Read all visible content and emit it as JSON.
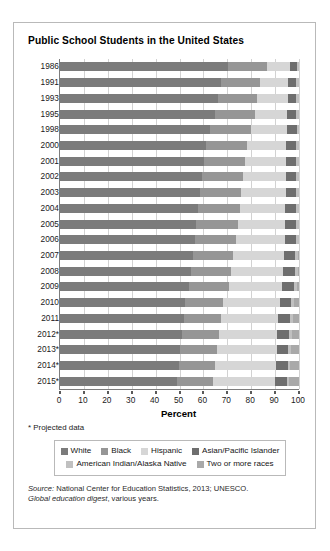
{
  "chart_data": {
    "type": "bar",
    "subtype": "stacked-horizontal-100-percent",
    "title": "Public School Students in the United States",
    "xlabel": "Percent",
    "ylabel": "",
    "xlim": [
      0,
      100
    ],
    "xticks": [
      0,
      10,
      20,
      30,
      40,
      50,
      60,
      70,
      80,
      90,
      100
    ],
    "grid": true,
    "grid_axis": "x",
    "legend_position": "bottom",
    "categories": [
      "1986",
      "1991",
      "1993",
      "1995",
      "1998",
      "2000",
      "2001",
      "2002",
      "2003",
      "2004",
      "2005",
      "2006",
      "2007",
      "2008",
      "2009",
      "2010",
      "2011",
      "2012*",
      "2013*",
      "2014*",
      "2015*"
    ],
    "series": [
      {
        "name": "White",
        "color": "#7b7b7b",
        "values": [
          70.4,
          67.4,
          66.1,
          64.8,
          62.9,
          61.2,
          60.3,
          59.5,
          58.7,
          57.9,
          57.1,
          56.5,
          55.5,
          54.9,
          54.1,
          52.4,
          51.7,
          51.1,
          50.3,
          49.6,
          48.9
        ]
      },
      {
        "name": "Black",
        "color": "#969696",
        "values": [
          16.1,
          16.4,
          16.5,
          16.8,
          17.2,
          17.2,
          17.2,
          17.2,
          17.2,
          17.3,
          17.2,
          17.1,
          16.8,
          16.7,
          16.5,
          15.8,
          15.6,
          15.4,
          15.3,
          15.2,
          15.1
        ]
      },
      {
        "name": "Hispanic",
        "color": "#d6d6d6",
        "values": [
          9.9,
          11.8,
          12.7,
          13.5,
          14.9,
          16.3,
          17.1,
          17.7,
          18.5,
          19.0,
          19.8,
          20.5,
          21.3,
          21.8,
          22.3,
          23.7,
          24.1,
          24.5,
          25.0,
          25.4,
          25.8
        ]
      },
      {
        "name": "Asian/Pacific Islander",
        "color": "#6e6e6e",
        "values": [
          2.8,
          3.3,
          3.6,
          3.7,
          4.0,
          4.2,
          4.3,
          4.4,
          4.5,
          4.6,
          4.6,
          4.7,
          4.8,
          4.8,
          4.9,
          4.9,
          4.9,
          5.0,
          5.0,
          5.1,
          5.1
        ]
      },
      {
        "name": "American Indian/Alaska Native",
        "color": "#c0c0c0",
        "values": [
          0.8,
          1.1,
          1.1,
          1.2,
          1.0,
          1.1,
          1.1,
          1.2,
          1.1,
          1.2,
          1.3,
          1.2,
          1.2,
          1.2,
          1.2,
          1.1,
          1.1,
          1.0,
          1.0,
          1.0,
          1.0
        ]
      },
      {
        "name": "Two or more races",
        "color": "#a9a9a9",
        "values": [
          0.0,
          0.0,
          0.0,
          0.0,
          0.0,
          0.0,
          0.0,
          0.0,
          0.0,
          0.0,
          0.0,
          0.0,
          0.4,
          0.6,
          1.0,
          2.1,
          2.6,
          3.0,
          3.4,
          3.7,
          4.1
        ]
      }
    ]
  },
  "footnote": "* Projected data",
  "source": {
    "prefix": "Source:",
    "text1": " National Center for Education Statistics, 2013; UNESCO.",
    "italic2": "Global education digest",
    "text2": ", various years."
  }
}
